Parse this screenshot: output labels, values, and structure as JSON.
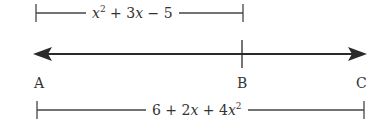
{
  "diagram": {
    "type": "number-line-segment",
    "top_segment": {
      "from": "A",
      "to": "B",
      "expression": "x^2 + 3x - 5",
      "parts": {
        "t1": "x",
        "t1_exp": "2",
        "rest_a": " + 3",
        "t2": "x",
        "rest_b": " − 5"
      }
    },
    "line": {
      "arrows": "both",
      "color": "#2a2a2a"
    },
    "points": [
      {
        "label": "A"
      },
      {
        "label": "B"
      },
      {
        "label": "C"
      }
    ],
    "bottom_segment": {
      "from": "A",
      "to": "C",
      "expression": "6 + 2x + 4x^2",
      "parts": {
        "c0": "6 + 2",
        "t1": "x",
        "mid": " + 4",
        "t2": "x",
        "t2_exp": "2"
      }
    }
  }
}
